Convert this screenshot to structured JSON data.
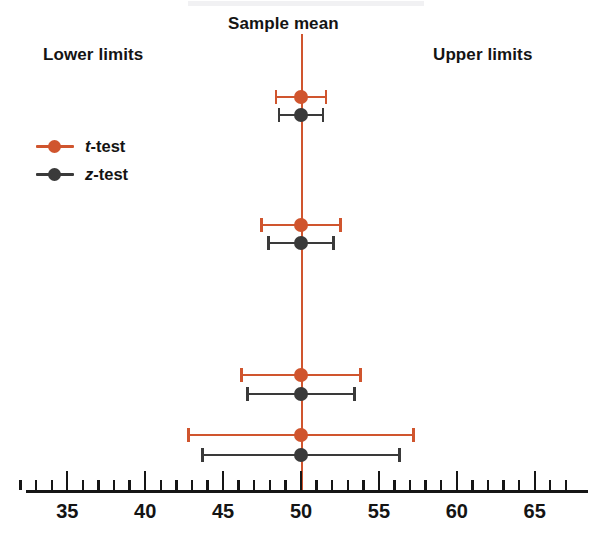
{
  "labels": {
    "sample_mean": "Sample mean",
    "lower_limits": "Lower limits",
    "upper_limits": "Upper limits"
  },
  "legend": {
    "position": "upper-left",
    "items": [
      {
        "name": "t-test",
        "symbol": "t",
        "suffix": "-test",
        "color": "#d0552e"
      },
      {
        "name": "z-test",
        "symbol": "z",
        "suffix": "-test",
        "color": "#3a3a3a"
      }
    ]
  },
  "colors": {
    "t_test": "#d0552e",
    "z_test": "#3a3a3a",
    "axis": "#161616",
    "center_line": "#d0552e",
    "background": "#ffffff"
  },
  "chart_data": {
    "type": "errorbar",
    "title": "",
    "subtitle": "",
    "xlabel": "",
    "ylabel": "",
    "xlim": [
      31.5,
      67.5
    ],
    "xticks": [
      35,
      40,
      45,
      50,
      55,
      60,
      65
    ],
    "xtick_labels": [
      "35",
      "40",
      "45",
      "50",
      "55",
      "60",
      "65"
    ],
    "minor_tick_interval": 1,
    "grid": false,
    "center_reference": 50,
    "center_reference_label": "Sample mean",
    "series": [
      {
        "name": "t-test",
        "color": "#d0552e",
        "points": [
          {
            "group": 1,
            "center": 50,
            "lower": 48.3,
            "upper": 51.7,
            "margin": 1.7
          },
          {
            "group": 2,
            "center": 50,
            "lower": 47.4,
            "upper": 52.6,
            "margin": 2.6
          },
          {
            "group": 3,
            "center": 50,
            "lower": 46.1,
            "upper": 53.9,
            "margin": 3.9
          },
          {
            "group": 4,
            "center": 50,
            "lower": 42.7,
            "upper": 57.3,
            "margin": 7.3
          }
        ]
      },
      {
        "name": "z-test",
        "color": "#3a3a3a",
        "points": [
          {
            "group": 1,
            "center": 50,
            "lower": 48.5,
            "upper": 51.5,
            "margin": 1.5
          },
          {
            "group": 2,
            "center": 50,
            "lower": 47.8,
            "upper": 52.2,
            "margin": 2.2
          },
          {
            "group": 3,
            "center": 50,
            "lower": 46.5,
            "upper": 53.5,
            "margin": 3.5
          },
          {
            "group": 4,
            "center": 50,
            "lower": 43.6,
            "upper": 56.4,
            "margin": 6.4
          }
        ]
      }
    ],
    "group_rows": [
      {
        "group": 1,
        "t_y": 90,
        "z_y": 108
      },
      {
        "group": 2,
        "t_y": 218,
        "z_y": 236
      },
      {
        "group": 3,
        "t_y": 368,
        "z_y": 387
      },
      {
        "group": 4,
        "t_y": 428,
        "z_y": 448
      }
    ]
  }
}
